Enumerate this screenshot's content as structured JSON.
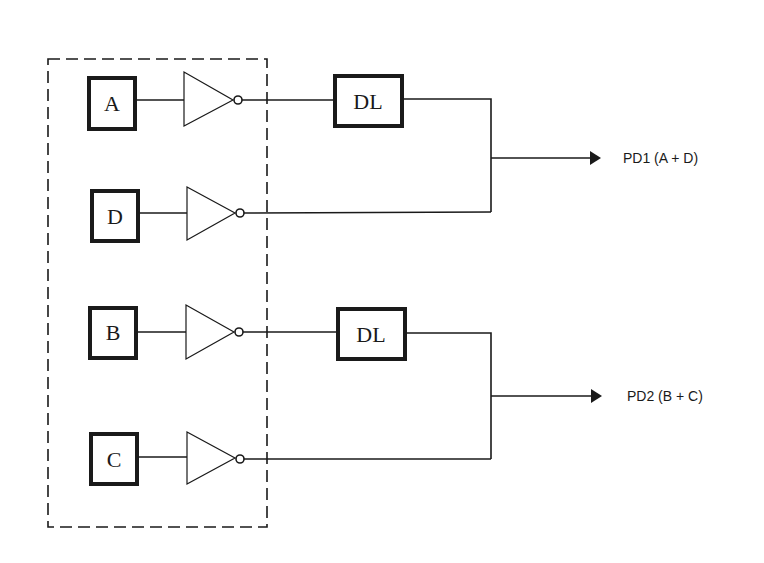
{
  "diagram": {
    "group_box": {
      "style": "dashed"
    },
    "inputs": [
      {
        "id": "A",
        "label": "A"
      },
      {
        "id": "D",
        "label": "D"
      },
      {
        "id": "B",
        "label": "B"
      },
      {
        "id": "C",
        "label": "C"
      }
    ],
    "inverters": [
      {
        "input": "A"
      },
      {
        "input": "D"
      },
      {
        "input": "B"
      },
      {
        "input": "C"
      }
    ],
    "delay_lines": [
      {
        "id": "DL1",
        "label": "DL",
        "input": "A"
      },
      {
        "id": "DL2",
        "label": "DL",
        "input": "B"
      }
    ],
    "outputs": [
      {
        "id": "PD1",
        "label": "PD1 (A + D)",
        "sources": [
          "DL1",
          "D"
        ]
      },
      {
        "id": "PD2",
        "label": "PD2 (B + C)",
        "sources": [
          "DL2",
          "C"
        ]
      }
    ],
    "colors": {
      "line": "#1a1a1a",
      "background": "#ffffff"
    }
  }
}
